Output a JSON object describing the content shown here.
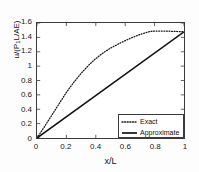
{
  "chart_data": {
    "type": "line",
    "title": "",
    "xlabel": "x/L",
    "ylabel": "u/(P1L/AE)",
    "ylabel_html": "u/(P<sub>1</sub>L/AE)",
    "xlim": [
      0,
      1
    ],
    "ylim": [
      0,
      1.6
    ],
    "xticks": [
      0,
      0.2,
      0.4,
      0.6,
      0.8,
      1
    ],
    "xticklabels": [
      "0",
      "0.2",
      "0.4",
      "0.6",
      "0.8",
      "1"
    ],
    "yticks": [
      0,
      0.2,
      0.4,
      0.6,
      0.8,
      1,
      1.2,
      1.4,
      1.6
    ],
    "yticklabels": [
      "0",
      "0.2",
      "0.4",
      "0.6",
      "0.8",
      "1",
      "1.2",
      "1.4",
      "1.6"
    ],
    "grid": false,
    "legend_position": "lower right",
    "series": [
      {
        "name": "Exact",
        "style": "dotted",
        "color": "#1a1a1a",
        "x": [
          0.0,
          0.05,
          0.1,
          0.15,
          0.2,
          0.25,
          0.3,
          0.35,
          0.4,
          0.45,
          0.5,
          0.55,
          0.6,
          0.65,
          0.7,
          0.75,
          0.78,
          0.8,
          0.85,
          0.9,
          0.95,
          1.0
        ],
        "y": [
          0.0,
          0.155,
          0.315,
          0.475,
          0.635,
          0.775,
          0.9,
          1.01,
          1.105,
          1.185,
          1.25,
          1.305,
          1.355,
          1.4,
          1.44,
          1.472,
          1.485,
          1.488,
          1.488,
          1.486,
          1.482,
          1.478
        ]
      },
      {
        "name": "Approximate",
        "style": "solid",
        "color": "#111111",
        "x": [
          0.0,
          1.0
        ],
        "y": [
          0.0,
          1.478
        ]
      }
    ],
    "legend": [
      {
        "label": "Exact",
        "style": "dotted"
      },
      {
        "label": "Approximate",
        "style": "solid"
      }
    ]
  },
  "axes": {
    "box_color": "#3a3a3a",
    "background": "#ffffff"
  }
}
